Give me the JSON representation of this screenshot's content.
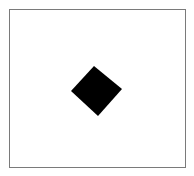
{
  "diagram": {
    "frame": {
      "x": 9,
      "y": 9,
      "width": 176,
      "height": 158,
      "stroke": "#7a7a7a"
    },
    "shape": {
      "type": "diamond",
      "fill": "#000000",
      "points": [
        [
          94,
          66
        ],
        [
          122,
          89
        ],
        [
          98,
          116
        ],
        [
          71,
          91
        ]
      ]
    }
  }
}
